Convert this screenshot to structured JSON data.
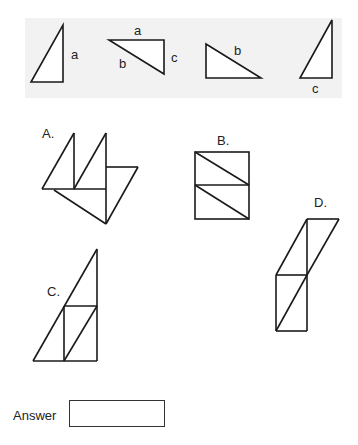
{
  "reference": {
    "triangles": [
      {
        "id": "t1",
        "labels": [
          "a"
        ]
      },
      {
        "id": "t2",
        "labels": [
          "a",
          "b",
          "c"
        ]
      },
      {
        "id": "t3",
        "labels": [
          "b"
        ]
      },
      {
        "id": "t4",
        "labels": [
          "c"
        ]
      }
    ]
  },
  "options": [
    {
      "label": "A."
    },
    {
      "label": "B."
    },
    {
      "label": "C."
    },
    {
      "label": "D."
    }
  ],
  "answer": {
    "label": "Answer",
    "value": ""
  }
}
